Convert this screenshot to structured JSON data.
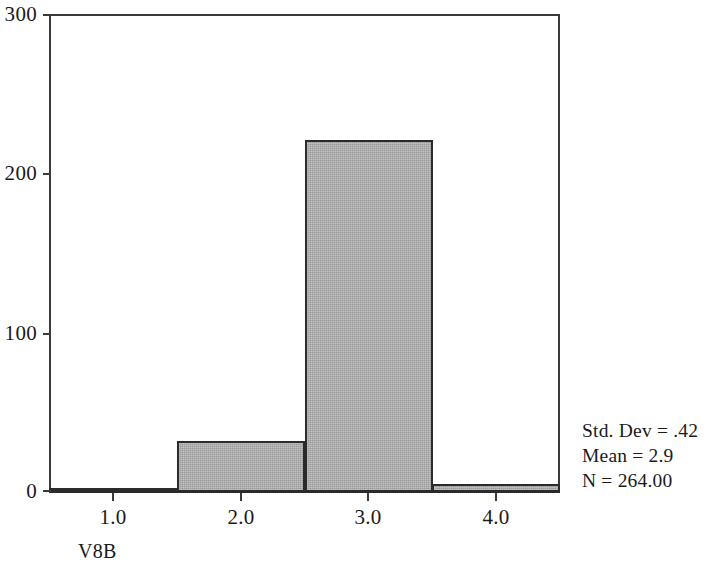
{
  "chart_data": {
    "type": "bar",
    "chart_style": "histogram",
    "title": "",
    "subtitle": "",
    "xlabel": "V8B",
    "ylabel": "",
    "categories": [
      "1.0",
      "2.0",
      "3.0",
      "4.0"
    ],
    "x": [
      1.0,
      2.0,
      3.0,
      4.0
    ],
    "values": [
      2,
      32,
      221,
      5
    ],
    "bin_edges": [
      0.5,
      1.5,
      2.5,
      3.5,
      4.5
    ],
    "bin_width": 1.0,
    "xlim": [
      0.5,
      4.5
    ],
    "ylim": [
      0,
      300
    ],
    "ytick_values": [
      0,
      100,
      200,
      300
    ],
    "ytick_labels": [
      "0",
      "100",
      "200",
      "300"
    ],
    "xtick_values": [
      1.0,
      2.0,
      3.0,
      4.0
    ],
    "xtick_labels": [
      "1.0",
      "2.0",
      "3.0",
      "4.0"
    ],
    "grid": false,
    "legend": null,
    "bar_fill_color": "#a9a9a9",
    "bar_edge_color": "#2b2b2b",
    "axis_color": "#3a3a3a",
    "annotations": [
      "Std. Dev = .42",
      "Mean = 2.9",
      "N = 264.00"
    ]
  },
  "axes": {
    "x_title": "V8B",
    "y_ticks": [
      {
        "label": "300",
        "value": 300
      },
      {
        "label": "200",
        "value": 200
      },
      {
        "label": "100",
        "value": 100
      },
      {
        "label": "0",
        "value": 0
      }
    ],
    "x_ticks": [
      {
        "label": "1.0",
        "value": 1.0
      },
      {
        "label": "2.0",
        "value": 2.0
      },
      {
        "label": "3.0",
        "value": 3.0
      },
      {
        "label": "4.0",
        "value": 4.0
      }
    ]
  },
  "stats": {
    "std_dev": "Std. Dev = .42",
    "mean": "Mean = 2.9",
    "n": "N = 264.00"
  }
}
